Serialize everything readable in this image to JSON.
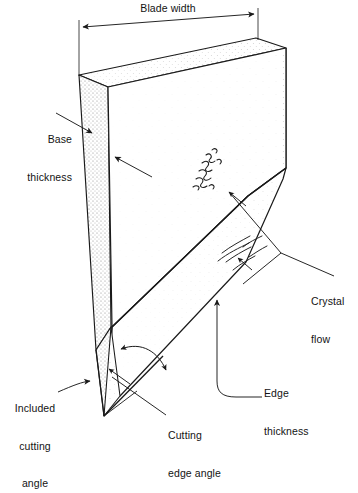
{
  "figure": {
    "type": "technical-line-diagram",
    "background_color": "#ffffff",
    "ink_color": "#1a1a1a"
  },
  "labels": {
    "blade_width": "Blade width",
    "base_thickness_l1": "Base",
    "base_thickness_l2": "thickness",
    "crystal_flow_l1": "Crystal",
    "crystal_flow_l2": "flow",
    "edge_thickness_l1": "Edge",
    "edge_thickness_l2": "thickness",
    "cutting_edge_angle_l1": "Cutting",
    "cutting_edge_angle_l2": "edge angle",
    "included_cutting_angle_l1": "Included",
    "included_cutting_angle_l2": "cutting",
    "included_cutting_angle_l3": "angle"
  },
  "callouts": [
    {
      "name": "blade-width",
      "text": "Blade width",
      "kind": "dimension-line",
      "arrows": "both-ends"
    },
    {
      "name": "base-thickness",
      "text": "Base thickness",
      "kind": "leader-arrow",
      "arrows": "one-end"
    },
    {
      "name": "crystal-flow",
      "text": "Crystal flow",
      "kind": "leader-arrow",
      "arrows": "two-leaders"
    },
    {
      "name": "edge-thickness",
      "text": "Edge thickness",
      "kind": "leader-arrow",
      "arrows": "one-end"
    },
    {
      "name": "cutting-edge-angle",
      "text": "Cutting edge angle",
      "kind": "angle-arc",
      "arrows": "both-ends"
    },
    {
      "name": "included-cutting-angle",
      "text": "Included cutting angle",
      "kind": "leader-arrow",
      "arrows": "one-end"
    }
  ]
}
